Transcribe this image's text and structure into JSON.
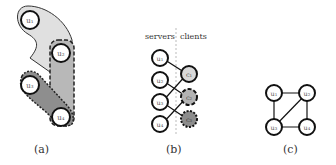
{
  "panels": {
    "a": {
      "caption": "(a)",
      "nodes": [
        "u1",
        "u2",
        "u3",
        "u4"
      ]
    },
    "b": {
      "caption": "(b)",
      "left_label": "servers",
      "right_label": "clients",
      "servers": [
        "u1",
        "u2",
        "u3",
        "u4"
      ],
      "clients": [
        "c1",
        "c2",
        "c3"
      ]
    },
    "c": {
      "caption": "(c)",
      "nodes": [
        "u1",
        "u2",
        "u3",
        "u4"
      ]
    }
  },
  "colors": {
    "light": "#d9d9d9",
    "mid": "#b3b3b3",
    "dark": "#8c8c8c",
    "stroke": "#1a1a1a"
  }
}
